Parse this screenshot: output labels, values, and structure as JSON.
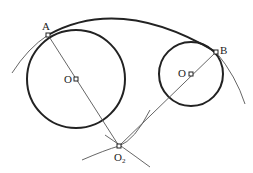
{
  "diagram": {
    "type": "geometry-construction",
    "labels": {
      "point_a": "A",
      "point_b": "B",
      "center_left": "O",
      "center_right": "O",
      "center_bottom": "O",
      "center_bottom_sub": "2"
    },
    "colors": {
      "circle_stroke": "#222222",
      "construction_line": "#555555",
      "background": "#ffffff"
    }
  }
}
